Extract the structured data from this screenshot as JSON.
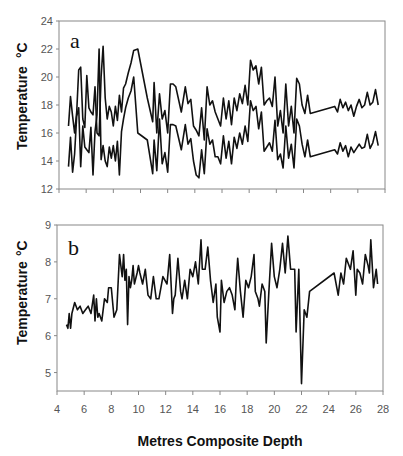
{
  "chart_data": [
    {
      "type": "line",
      "panel_label": "a",
      "title": "",
      "xlabel": "",
      "ylabel": "Temperature",
      "yunit": "°C",
      "xlim": [
        4,
        28
      ],
      "ylim": [
        12,
        24
      ],
      "yticks": [
        12,
        14,
        16,
        18,
        20,
        22,
        24
      ],
      "grid": false,
      "series": [
        {
          "name": "upper",
          "x": [
            4.7,
            4.85,
            5.0,
            5.15,
            5.3,
            5.45,
            5.6,
            5.75,
            5.9,
            6.05,
            6.2,
            6.35,
            6.5,
            6.65,
            6.8,
            6.95,
            7.1,
            7.25,
            7.4,
            7.55,
            7.7,
            7.85,
            8.0,
            8.15,
            8.3,
            8.45,
            8.6,
            8.75,
            8.9,
            9.1,
            9.3,
            9.5,
            9.8,
            10.5,
            10.9,
            11.0,
            11.2,
            11.4,
            11.6,
            11.8,
            12.0,
            12.2,
            12.4,
            12.6,
            13.0,
            13.3,
            13.5,
            13.7,
            13.9,
            14.1,
            14.3,
            14.5,
            14.7,
            14.9,
            15.1,
            15.3,
            15.5,
            15.7,
            15.9,
            16.1,
            16.3,
            16.5,
            16.7,
            16.9,
            17.1,
            17.3,
            17.5,
            17.7,
            17.9,
            18.1,
            18.3,
            18.5,
            18.7,
            18.9,
            19.1,
            19.3,
            19.5,
            19.7,
            19.9,
            20.1,
            20.3,
            20.5,
            20.7,
            20.9,
            21.1,
            21.3,
            21.5,
            21.7,
            21.9,
            22.1,
            22.3,
            22.5,
            24.3,
            24.5,
            24.7,
            24.9,
            25.1,
            25.3,
            25.5,
            25.7,
            25.9,
            26.1,
            26.3,
            26.5,
            26.7,
            26.9,
            27.1,
            27.3,
            27.5
          ],
          "values": [
            16.5,
            18.6,
            17.2,
            16.0,
            17.5,
            20.5,
            20.7,
            17.0,
            16.4,
            20.1,
            17.8,
            17.5,
            17.3,
            19.3,
            16.0,
            15.8,
            20.0,
            22.2,
            18.5,
            17.0,
            17.9,
            17.5,
            16.5,
            17.9,
            16.9,
            18.7,
            17.5,
            19.2,
            19.5,
            20.3,
            21.0,
            21.9,
            22.0,
            18.5,
            16.8,
            19.6,
            16.0,
            18.8,
            17.0,
            17.6,
            16.0,
            19.5,
            19.5,
            19.3,
            17.5,
            19.3,
            18.1,
            18.4,
            16.5,
            16.2,
            15.8,
            17.8,
            15.5,
            19.3,
            18.0,
            18.3,
            17.5,
            17.0,
            16.5,
            18.5,
            17.0,
            18.3,
            16.6,
            18.5,
            17.6,
            18.8,
            18.1,
            19.4,
            18.0,
            21.2,
            20.5,
            20.8,
            19.5,
            20.7,
            18.0,
            18.3,
            18.5,
            17.9,
            20.0,
            16.5,
            17.6,
            16.0,
            19.5,
            16.5,
            17.9,
            16.0,
            19.9,
            19.5,
            18.0,
            17.4,
            18.7,
            17.4,
            17.9,
            17.5,
            18.4,
            17.8,
            18.2,
            17.6,
            18.0,
            17.2,
            17.9,
            18.4,
            17.8,
            18.0,
            18.9,
            18.0,
            18.2,
            19.1,
            18.0
          ]
        },
        {
          "name": "lower",
          "x": [
            4.7,
            4.85,
            5.0,
            5.15,
            5.3,
            5.45,
            5.6,
            5.75,
            5.9,
            6.05,
            6.2,
            6.35,
            6.5,
            6.65,
            6.8,
            6.95,
            7.1,
            7.25,
            7.4,
            7.55,
            7.7,
            7.85,
            8.0,
            8.15,
            8.3,
            8.45,
            8.6,
            8.75,
            8.9,
            9.1,
            9.3,
            9.5,
            9.8,
            10.5,
            10.9,
            11.0,
            11.2,
            11.4,
            11.6,
            11.8,
            12.0,
            12.2,
            12.4,
            12.6,
            13.0,
            13.3,
            13.5,
            13.7,
            13.9,
            14.1,
            14.3,
            14.5,
            14.7,
            14.9,
            15.1,
            15.3,
            15.5,
            15.7,
            15.9,
            16.1,
            16.3,
            16.5,
            16.7,
            16.9,
            17.1,
            17.3,
            17.5,
            17.7,
            17.9,
            18.1,
            18.3,
            18.5,
            18.7,
            18.9,
            19.1,
            19.3,
            19.5,
            19.7,
            19.9,
            20.1,
            20.3,
            20.5,
            20.7,
            20.9,
            21.1,
            21.3,
            21.5,
            21.7,
            21.9,
            22.1,
            22.3,
            22.5,
            24.3,
            24.5,
            24.7,
            24.9,
            25.1,
            25.3,
            25.5,
            25.7,
            25.9,
            26.1,
            26.3,
            26.5,
            26.7,
            26.9,
            27.1,
            27.3,
            27.5
          ],
          "values": [
            13.6,
            15.7,
            13.2,
            14.5,
            17.2,
            17.8,
            13.6,
            16.5,
            15.0,
            14.8,
            14.6,
            16.4,
            13.0,
            16.1,
            17.3,
            22.0,
            14.1,
            15.1,
            14.0,
            13.6,
            15.0,
            14.2,
            15.1,
            14.0,
            15.4,
            13.0,
            16.1,
            17.0,
            17.8,
            18.5,
            19.0,
            20.0,
            16.0,
            15.5,
            13.1,
            15.5,
            13.3,
            17.0,
            13.8,
            14.6,
            13.2,
            16.6,
            16.6,
            16.5,
            14.8,
            16.6,
            15.2,
            15.6,
            14.0,
            13.0,
            12.8,
            14.8,
            13.1,
            16.3,
            15.2,
            15.5,
            14.3,
            14.3,
            13.8,
            15.8,
            14.2,
            15.4,
            13.8,
            15.7,
            14.9,
            16.0,
            15.2,
            16.5,
            15.4,
            18.3,
            17.6,
            17.9,
            16.3,
            17.5,
            14.7,
            15.0,
            15.3,
            14.7,
            16.9,
            14.1,
            14.5,
            13.5,
            16.5,
            14.2,
            15.2,
            13.5,
            17.0,
            16.5,
            15.2,
            14.3,
            15.5,
            14.3,
            14.8,
            14.5,
            15.3,
            14.7,
            15.1,
            14.3,
            15.0,
            14.6,
            14.9,
            15.2,
            14.9,
            15.0,
            15.9,
            14.9,
            15.3,
            16.1,
            15.1
          ]
        }
      ]
    },
    {
      "type": "line",
      "panel_label": "b",
      "title": "",
      "xlabel": "Metres Composite Depth",
      "ylabel": "Temperature",
      "yunit": "°C",
      "xlim": [
        4,
        28
      ],
      "ylim": [
        4.5,
        9
      ],
      "yticks": [
        5,
        6,
        7,
        8,
        9
      ],
      "xticks": [
        4,
        6,
        8,
        10,
        12,
        14,
        16,
        18,
        20,
        22,
        24,
        26,
        28
      ],
      "grid": false,
      "series": [
        {
          "name": "temperature",
          "x": [
            4.7,
            4.8,
            4.9,
            5.0,
            5.1,
            5.3,
            5.5,
            5.7,
            5.9,
            6.1,
            6.3,
            6.5,
            6.7,
            6.8,
            6.9,
            7.0,
            7.1,
            7.3,
            7.5,
            7.7,
            7.8,
            8.0,
            8.2,
            8.4,
            8.6,
            8.8,
            8.9,
            9.0,
            9.1,
            9.2,
            9.3,
            9.4,
            9.5,
            9.6,
            9.7,
            9.9,
            10.0,
            10.1,
            10.3,
            10.5,
            10.7,
            10.9,
            11.1,
            11.3,
            11.5,
            11.8,
            12.1,
            12.3,
            12.5,
            12.6,
            12.7,
            12.9,
            13.1,
            13.2,
            13.4,
            13.6,
            13.8,
            14.0,
            14.2,
            14.4,
            14.6,
            14.7,
            14.9,
            15.1,
            15.3,
            15.5,
            15.7,
            15.8,
            16.0,
            16.1,
            16.3,
            16.5,
            16.7,
            16.9,
            17.1,
            17.2,
            17.3,
            17.5,
            17.7,
            17.9,
            18.1,
            18.3,
            18.5,
            18.6,
            18.8,
            18.9,
            19.1,
            19.3,
            19.4,
            19.6,
            19.8,
            20.0,
            20.2,
            20.4,
            20.6,
            20.8,
            21.0,
            21.2,
            21.5,
            21.6,
            21.8,
            22.0,
            22.2,
            22.4,
            22.6,
            24.4,
            24.6,
            24.7,
            24.9,
            25.1,
            25.3,
            25.5,
            25.6,
            25.8,
            26.0,
            26.1,
            26.3,
            26.5,
            26.7,
            26.9,
            27.0,
            27.1,
            27.3,
            27.5,
            27.6
          ],
          "values": [
            6.3,
            6.2,
            6.6,
            6.2,
            6.6,
            6.9,
            6.7,
            6.8,
            6.6,
            6.7,
            6.8,
            6.6,
            7.1,
            6.4,
            7.0,
            6.5,
            6.6,
            6.4,
            7.0,
            6.9,
            7.3,
            7.3,
            6.5,
            6.7,
            8.2,
            7.6,
            8.2,
            7.5,
            7.8,
            6.3,
            7.6,
            7.3,
            7.5,
            7.9,
            7.4,
            7.7,
            7.9,
            7.7,
            7.4,
            7.8,
            7.1,
            7.0,
            7.6,
            7.0,
            7.0,
            7.6,
            7.4,
            8.2,
            6.6,
            7.0,
            7.1,
            8.1,
            7.2,
            7.0,
            7.5,
            7.0,
            7.8,
            7.6,
            8.0,
            7.4,
            8.6,
            7.8,
            7.8,
            8.4,
            7.5,
            6.9,
            7.4,
            6.5,
            6.1,
            7.5,
            6.9,
            7.2,
            7.3,
            7.1,
            6.7,
            7.5,
            8.1,
            7.2,
            6.5,
            7.5,
            7.3,
            7.6,
            8.2,
            7.2,
            7.0,
            6.8,
            7.4,
            7.2,
            5.8,
            7.2,
            8.5,
            7.6,
            7.3,
            7.8,
            8.5,
            7.7,
            8.7,
            7.8,
            7.8,
            6.1,
            7.8,
            4.7,
            6.7,
            6.5,
            7.2,
            7.7,
            7.3,
            7.1,
            7.7,
            7.4,
            8.1,
            7.9,
            7.8,
            8.3,
            7.1,
            7.8,
            7.7,
            7.4,
            8.2,
            7.9,
            7.7,
            8.6,
            7.3,
            7.8,
            7.4
          ]
        }
      ]
    }
  ],
  "panels": {
    "a": {
      "label": "a",
      "ylabel": "Temperature",
      "unit": "°C",
      "yticks": [
        "24",
        "22",
        "20",
        "18",
        "16",
        "14",
        "12"
      ]
    },
    "b": {
      "label": "b",
      "ylabel": "Temperature",
      "unit": "°C",
      "yticks": [
        "9",
        "8",
        "7",
        "6",
        "5"
      ]
    }
  },
  "xaxis": {
    "label": "Metres Composite Depth",
    "ticks": [
      "4",
      "6",
      "8",
      "10",
      "12",
      "14",
      "16",
      "18",
      "20",
      "22",
      "24",
      "26",
      "28"
    ]
  },
  "colors": {
    "line": "#111111",
    "axis": "#888888",
    "text": "#555555"
  }
}
